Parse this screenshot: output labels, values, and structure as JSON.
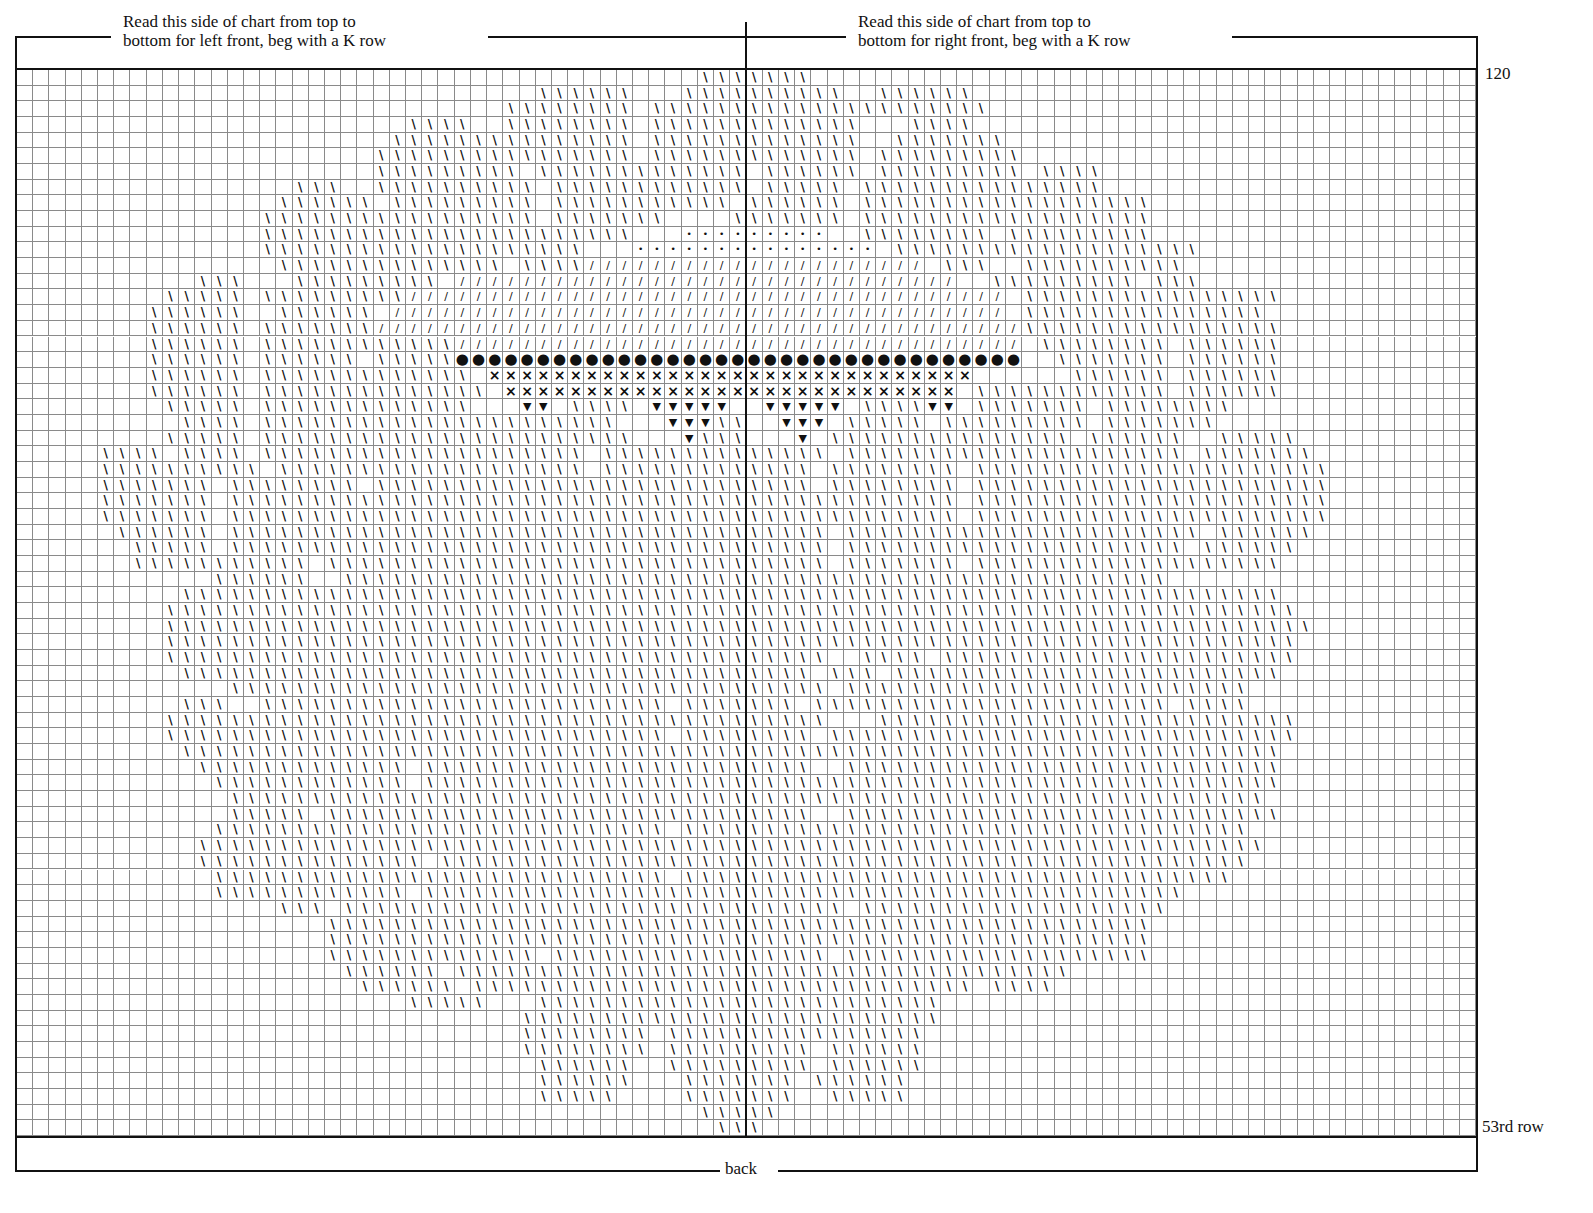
{
  "chart": {
    "left_heading": [
      "Read this side of chart from top to",
      "bottom for left front, beg with a K row"
    ],
    "right_heading": [
      "Read this side of chart from top to",
      "bottom for right front, beg with a K row"
    ],
    "top_row_label": "120",
    "bottom_row_label": "53rd row",
    "bottom_label": "back"
  },
  "chart_data": {
    "type": "heatmap",
    "columns": 90,
    "rows": 68,
    "row_range": [
      53,
      120
    ],
    "center_divider_after_column": 45,
    "legend_symbols": {
      "\\": "backslash stitch (main motif)",
      "/": "forward slash stitch",
      "•": "small dot",
      "●": "large dot",
      "×": "cross",
      "▼": "triangle"
    },
    "encoding": "Each row string lists runs as start-end:symbol, columns 1..90 from left, rows top (120) to bottom (53)",
    "grid_rows": [
      "43-49:\\",
      "33-38:\\|42-51:\\|54-59:\\",
      "31-38:\\|40-52:\\|53-60:\\",
      "25-28:\\|31-38:\\|40-52:\\|56-59:\\",
      "24-30:\\|31-38:\\|40-52:\\|55-61:\\",
      "23-31:\\|32-38:\\|40-52:\\|54-62:\\",
      "23-31:\\|33-39:\\|40-45:\\|47-52:\\|54-62:\\|64-67:\\",
      "18-20:\\|23-32:\\|34-40:\\|41-45:\\|47-51:\\|53-62:\\|63-67:\\",
      "17-22:\\|24-32:\\|34-40:\\|41-44:\\|46-51:\\|53-62:\\|63-70:\\",
      "16-25:\\|26-32:\\|34-40:\\|45-51:\\|53-62:\\|63-70:\\",
      "16-30:\\|31-35:\\|36-38:\\|42-45:•|46-50:•|53-60:\\|62-70:\\",
      "16-30:\\|31-35:\\|39-45:•|46-53:•|55-64:\\|65-73:\\",
      "17-22:\\|23-30:\\|32-35:\\|36-45:/|46-56:/|58-60:\\|63-72:\\",
      "12-14:\\|18-26:\\|28-33:/|34-45:/|46-58:/|61-69:\\|71-73:\\",
      "10-14:\\|16-24:\\|25-33:/|34-45:/|46-61:/|63-73:\\|73-78:\\",
      "9-14:\\|17-22:\\|24-33:/|34-45:/|46-61:/|63-71:\\|72-77:\\",
      "9-14:\\|16-22:\\|23-33:/|34-45:/|46-62:/|63-71:\\|72-78:\\",
      "9-14:\\|16-22:\\|23-27:\\|28-33:/|34-45:/|46-62:/|64-71:\\|73-78:\\",
      "9-14:\\|16-21:\\|23-27:\\|28-45:●|46-62:●|65-71:\\|73-78:\\",
      "9-14:\\|16-22:\\|23-28:\\|30-45:×|46-59:×|66-71:\\|73-78:\\",
      "9-14:\\|16-22:\\|23-29:\\|31-45:×|46-58:×|60-65:\\|66-71:\\|73-78:\\",
      "10-14:\\|16-21:\\|22-28:\\|32-33:▼|35-38:\\|40-44:▼|47-51:▼|53-56:\\|57-58:▼|60-66:\\|68-75:\\",
      "11-14:\\|16-21:\\|22-32:\\|33-37:\\|41-43:▼|44-45:\\|48-50:▼|52-56:\\|58-66:\\|68-74:\\",
      "10-14:\\|16-21:\\|22-28:\\|29-35:\\|36-38:\\|42-42:▼|43-45:\\|49-49:▼|51-58:\\|59-65:\\|67-72:\\|75-79:\\",
      "6-9:\\|11-14:\\|16-21:\\|22-27:\\|28-35:\\|37-45:\\|46-50:\\|52-59:\\|60-66:\\|67-72:\\|74-80:\\",
      "6-12:\\|13-15:\\|17-21:\\|22-27:\\|28-35:\\|37-45:\\|46-49:\\|51-58:\\|60-66:\\|67-73:\\|74-81:\\",
      "6-12:\\|14-18:\\|19-21:\\|23-31:\\|32-37:\\|38-45:\\|46-49:\\|51-58:\\|60-66:\\|67-73:\\|74-81:\\",
      "6-12:\\|14-17:\\|18-26:\\|27-33:\\|34-45:\\|46-50:\\|51-58:\\|60-66:\\|67-73:\\|74-81:\\",
      "6-12:\\|14-20:\\|21-26:\\|27-35:\\|36-45:\\|46-50:\\|51-58:\\|60-66:\\|67-73:\\|74-81:\\",
      "7-12:\\|14-20:\\|21-26:\\|27-33:\\|34-45:\\|46-50:\\|52-59:\\|60-65:\\|66-73:\\|75-80:\\",
      "8-12:\\|14-20:\\|21-26:\\|27-33:\\|34-45:\\|46-50:\\|52-59:\\|60-66:\\|67-72:\\|74-79:\\",
      "8-13:\\|14-18:\\|20-27:\\|28-33:\\|34-45:\\|46-50:\\|52-58:\\|60-66:\\|67-72:\\|73-78:\\",
      "13-18:\\|21-27:\\|28-32:\\|33-38:\\|39-45:\\|46-50:\\|51-57:\\|58-66:\\|67-71:\\",
      "11-17:\\|18-24:\\|25-31:\\|32-36:\\|37-45:\\|46-50:\\|51-55:\\|56-63:\\|64-71:\\|72-78:\\",
      "10-16:\\|17-23:\\|24-30:\\|31-37:\\|38-45:\\|46-50:\\|51-56:\\|57-63:\\|64-73:\\|74-79:\\",
      "10-14:\\|15-22:\\|23-27:\\|28-35:\\|36-45:\\|46-52:\\|53-60:\\|61-68:\\|69-76:\\|77-80:\\",
      "10-16:\\|17-23:\\|24-30:\\|31-37:\\|38-45:\\|46-51:\\|52-58:\\|59-66:\\|67-74:\\|75-79:\\",
      "10-16:\\|17-23:\\|24-31:\\|32-38:\\|39-45:\\|46-50:\\|53-56:\\|58-66:\\|67-73:\\|74-79:\\",
      "11-17:\\|18-24:\\|25-32:\\|33-39:\\|40-45:\\|46-49:\\|51-53:\\|55-62:\\|63-70:\\|71-78:\\",
      "14-19:\\|20-26:\\|27-33:\\|34-40:\\|41-45:\\|46-50:\\|52-60:\\|61-67:\\|68-76:\\",
      "11-13:\\|16-24:\\|25-32:\\|33-40:\\|42-45:\\|46-48:\\|50-55:\\|56-62:\\|63-71:\\|73-76:\\",
      "10-16:\\|17-24:\\|25-34:\\|35-41:\\|42-45:\\|46-50:\\|54-60:\\|61-67:\\|68-79:\\",
      "10-16:\\|17-26:\\|27-34:\\|35-40:\\|42-45:\\|46-49:\\|51-58:\\|59-66:\\|67-77:\\|78-79:\\",
      "11-17:\\|18-25:\\|26-33:\\|34-40:\\|41-45:\\|46-50:\\|51-59:\\|60-67:\\|68-78:\\",
      "12-18:\\|19-24:\\|26-33:\\|34-40:\\|41-45:\\|46-49:\\|52-60:\\|61-68:\\|69-78:\\",
      "13-18:\\|19-24:\\|26-34:\\|35-41:\\|42-45:\\|46-50:\\|51-57:\\|58-66:\\|67-73:\\|74-78:\\",
      "14-20:\\|21-26:\\|27-33:\\|34-40:\\|41-45:\\|46-52:\\|53-59:\\|60-68:\\|69-77:\\",
      "14-18:\\|20-26:\\|27-34:\\|35-41:\\|42-45:\\|46-49:\\|52-58:\\|59-66:\\|67-78:\\",
      "13-19:\\|20-26:\\|27-33:\\|34-40:\\|42-45:\\|46-50:\\|51-57:\\|58-66:\\|67-76:\\",
      "12-19:\\|20-26:\\|27-35:\\|36-41:\\|42-45:\\|46-51:\\|52-57:\\|58-66:\\|67-77:\\",
      "12-18:\\|19-25:\\|27-34:\\|35-41:\\|42-45:\\|46-51:\\|52-59:\\|60-66:\\|67-76:\\",
      "13-18:\\|19-25:\\|26-33:\\|34-40:\\|42-45:\\|46-52:\\|53-58:\\|59-66:\\|67-75:\\",
      "13-18:\\|19-24:\\|26-34:\\|35-41:\\|42-45:\\|46-51:\\|52-59:\\|60-66:\\|67-72:\\",
      "17-19:\\|21-28:\\|29-35:\\|36-41:\\|42-45:\\|46-51:\\|53-60:\\|61-66:\\|67-71:\\",
      "20-25:\\|26-33:\\|34-40:\\|41-45:\\|46-52:\\|53-60:\\|61-70:\\",
      "20-26:\\|27-33:\\|34-40:\\|41-45:\\|46-50:\\|51-60:\\|61-70:\\",
      "20-25:\\|26-32:\\|34-40:\\|41-45:\\|46-50:\\|52-59:\\|60-68:\\|69-70:\\",
      "21-26:\\|28-33:\\|34-40:\\|41-45:\\|46-51:\\|52-59:\\|60-65:\\",
      "22-27:\\|29-36:\\|37-45:\\|46-52:\\|53-59:\\|61-64:\\",
      "25-29:\\|33-40:\\|41-45:\\|46-51:\\|52-57:\\",
      "32-40:\\|41-45:\\|46-51:\\|52-57:\\",
      "32-39:\\|41-45:\\|46-51:\\|52-56:\\",
      "32-39:\\|41-45:\\|46-49:\\|51-56:\\",
      "33-38:\\|41-45:\\|46-49:\\|51-56:\\",
      "33-38:\\|42-45:\\|46-48:\\|50-55:\\",
      "33-37:\\|42-45:\\|46-48:\\|51-55:\\",
      "43-45:\\|46-47:\\",
      "44-45:\\|46-46:\\"
    ]
  }
}
